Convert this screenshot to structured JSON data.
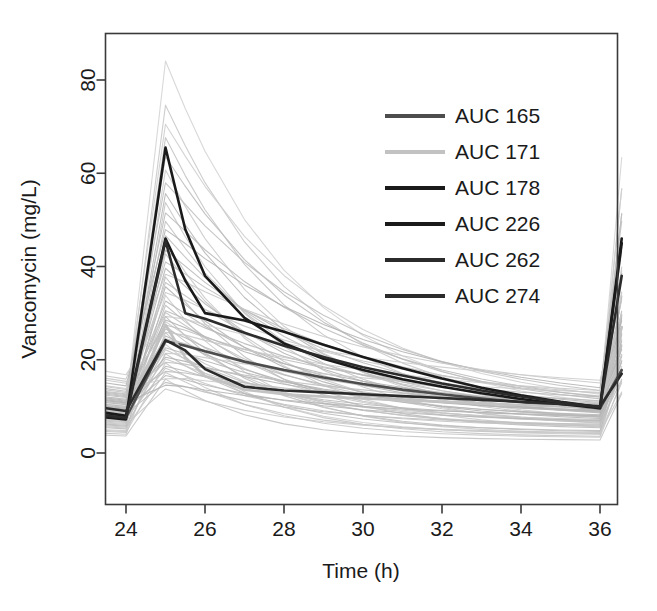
{
  "chart_data": {
    "type": "line",
    "title": "",
    "xlabel": "Time (h)",
    "ylabel": "Vancomycin (mg/L)",
    "xlim": [
      23.5,
      36.6
    ],
    "ylim": [
      -2,
      88
    ],
    "xticks": [
      24,
      26,
      28,
      30,
      32,
      34,
      36
    ],
    "xtick_labels": [
      "24",
      "26",
      "28",
      "30",
      "32",
      "34",
      "36"
    ],
    "yticks": [
      0,
      20,
      40,
      60,
      80
    ],
    "ytick_labels": [
      "0",
      "20",
      "40",
      "60",
      "80"
    ],
    "grid": false,
    "legend_position": "top-right",
    "x": [
      23.5,
      24.0,
      25.0,
      25.5,
      26.0,
      27.0,
      28.0,
      29.0,
      30.0,
      31.0,
      32.0,
      33.0,
      34.0,
      35.0,
      36.0,
      36.55
    ],
    "highlighted_series": [
      {
        "name": "AUC 165",
        "label": "AUC 165",
        "color": "#4d4d4d",
        "width": 2.6,
        "values": [
          8.2,
          7.6,
          24.0,
          23.0,
          21.8,
          19.6,
          17.8,
          16.2,
          14.8,
          13.6,
          12.6,
          11.7,
          10.9,
          10.2,
          9.6,
          17.8
        ]
      },
      {
        "name": "AUC 171",
        "label": "AUC 171",
        "color": "#c2c2c2",
        "width": 2.6,
        "values": [
          9.0,
          8.4,
          27.5,
          20.5,
          16.5,
          13.6,
          12.6,
          12.1,
          11.7,
          11.3,
          11.0,
          10.6,
          10.3,
          10.0,
          9.7,
          27.0
        ]
      },
      {
        "name": "AUC 178",
        "label": "AUC 178",
        "color": "#1a1a1a",
        "width": 2.6,
        "values": [
          8.6,
          8.0,
          46.0,
          37.0,
          30.0,
          28.4,
          26.0,
          23.2,
          20.6,
          18.2,
          16.0,
          14.0,
          12.4,
          11.0,
          9.8,
          46.0
        ]
      },
      {
        "name": "AUC 226",
        "label": "AUC 226",
        "color": "#1a1a1a",
        "width": 2.6,
        "values": [
          7.6,
          7.2,
          65.5,
          48.0,
          38.0,
          29.0,
          23.5,
          20.2,
          17.8,
          15.8,
          14.2,
          12.8,
          11.6,
          10.5,
          9.6,
          45.0
        ]
      },
      {
        "name": "AUC 262",
        "label": "AUC 262",
        "color": "#2b2b2b",
        "width": 2.6,
        "values": [
          8.0,
          7.5,
          45.5,
          30.0,
          28.8,
          25.8,
          23.0,
          20.6,
          18.4,
          16.6,
          14.9,
          13.4,
          12.1,
          10.9,
          9.8,
          38.0
        ]
      },
      {
        "name": "AUC 274",
        "label": "AUC 274",
        "color": "#2b2b2b",
        "width": 2.6,
        "values": [
          9.6,
          9.0,
          24.2,
          22.0,
          18.0,
          14.2,
          13.4,
          13.0,
          12.6,
          12.2,
          11.8,
          11.4,
          11.0,
          10.5,
          10.0,
          17.0
        ]
      }
    ],
    "background_series_count": 60,
    "background_color": "#b0b0b0",
    "background_description": "Spaghetti plot of individual vancomycin concentration-time profiles; trough ~2-18 mg/L before the 24 h dose, peaks 20-85 mg/L at 25 h, decaying to troughs 2-17 mg/L at 36 h, then rising again after the 36 h dose.",
    "background_series": [
      {
        "peak": 84.5,
        "trough0": 10.5,
        "trough36": 11.0,
        "decay": 0.3,
        "shade": "#d4d4d4"
      },
      {
        "peak": 75.0,
        "trough0": 9.8,
        "trough36": 10.2,
        "decay": 0.29,
        "shade": "#c9c9c9"
      },
      {
        "peak": 71.0,
        "trough0": 12.0,
        "trough36": 12.6,
        "decay": 0.25,
        "shade": "#cfcfcf"
      },
      {
        "peak": 68.0,
        "trough0": 8.8,
        "trough36": 9.2,
        "decay": 0.3,
        "shade": "#c4c4c4"
      },
      {
        "peak": 64.0,
        "trough0": 11.2,
        "trough36": 11.6,
        "decay": 0.26,
        "shade": "#bdbdbd"
      },
      {
        "peak": 61.0,
        "trough0": 7.4,
        "trough36": 7.8,
        "decay": 0.32,
        "shade": "#cccccc"
      },
      {
        "peak": 58.5,
        "trough0": 13.5,
        "trough36": 13.4,
        "decay": 0.22,
        "shade": "#c0c0c0"
      },
      {
        "peak": 56.0,
        "trough0": 9.0,
        "trough36": 8.6,
        "decay": 0.31,
        "shade": "#b8b8b8"
      },
      {
        "peak": 54.0,
        "trough0": 6.6,
        "trough36": 6.4,
        "decay": 0.34,
        "shade": "#c7c7c7"
      },
      {
        "peak": 52.0,
        "trough0": 12.8,
        "trough36": 12.0,
        "decay": 0.21,
        "shade": "#bbbbbb"
      },
      {
        "peak": 50.0,
        "trough0": 8.2,
        "trough36": 7.6,
        "decay": 0.3,
        "shade": "#c3c3c3"
      },
      {
        "peak": 48.5,
        "trough0": 15.0,
        "trough36": 14.0,
        "decay": 0.19,
        "shade": "#b5b5b5"
      },
      {
        "peak": 47.0,
        "trough0": 10.0,
        "trough36": 9.4,
        "decay": 0.27,
        "shade": "#c1c1c1"
      },
      {
        "peak": 45.5,
        "trough0": 5.8,
        "trough36": 5.6,
        "decay": 0.36,
        "shade": "#cacaca"
      },
      {
        "peak": 44.0,
        "trough0": 11.6,
        "trough36": 10.8,
        "decay": 0.23,
        "shade": "#b9b9b9"
      },
      {
        "peak": 43.0,
        "trough0": 7.0,
        "trough36": 6.8,
        "decay": 0.33,
        "shade": "#c5c5c5"
      },
      {
        "peak": 41.5,
        "trough0": 13.0,
        "trough36": 12.2,
        "decay": 0.2,
        "shade": "#bebebe"
      },
      {
        "peak": 40.0,
        "trough0": 9.4,
        "trough36": 8.8,
        "decay": 0.28,
        "shade": "#b7b7b7"
      },
      {
        "peak": 39.0,
        "trough0": 16.5,
        "trough36": 15.0,
        "decay": 0.17,
        "shade": "#c8c8c8"
      },
      {
        "peak": 38.0,
        "trough0": 6.2,
        "trough36": 5.4,
        "decay": 0.37,
        "shade": "#bcbcbc"
      },
      {
        "peak": 37.0,
        "trough0": 11.0,
        "trough36": 10.0,
        "decay": 0.24,
        "shade": "#c2c2c2"
      },
      {
        "peak": 36.0,
        "trough0": 8.6,
        "trough36": 7.4,
        "decay": 0.3,
        "shade": "#b4b4b4"
      },
      {
        "peak": 35.0,
        "trough0": 14.2,
        "trough36": 12.8,
        "decay": 0.18,
        "shade": "#c6c6c6"
      },
      {
        "peak": 34.0,
        "trough0": 4.8,
        "trough36": 4.2,
        "decay": 0.4,
        "shade": "#cbcbcb"
      },
      {
        "peak": 33.0,
        "trough0": 10.4,
        "trough36": 9.0,
        "decay": 0.26,
        "shade": "#b6b6b6"
      },
      {
        "peak": 32.0,
        "trough0": 7.8,
        "trough36": 6.6,
        "decay": 0.32,
        "shade": "#c0c0c0"
      },
      {
        "peak": 31.0,
        "trough0": 12.4,
        "trough36": 11.2,
        "decay": 0.21,
        "shade": "#bababa"
      },
      {
        "peak": 30.5,
        "trough0": 9.2,
        "trough36": 8.0,
        "decay": 0.29,
        "shade": "#c4c4c4"
      },
      {
        "peak": 30.0,
        "trough0": 17.5,
        "trough36": 15.6,
        "decay": 0.15,
        "shade": "#cdcdcd"
      },
      {
        "peak": 29.5,
        "trough0": 5.4,
        "trough36": 4.6,
        "decay": 0.38,
        "shade": "#bfbfbf"
      },
      {
        "peak": 29.0,
        "trough0": 11.8,
        "trough36": 10.4,
        "decay": 0.22,
        "shade": "#b3b3b3"
      },
      {
        "peak": 28.5,
        "trough0": 8.0,
        "trough36": 6.8,
        "decay": 0.31,
        "shade": "#c7c7c7"
      },
      {
        "peak": 28.0,
        "trough0": 13.8,
        "trough36": 12.0,
        "decay": 0.19,
        "shade": "#bdbdbd"
      },
      {
        "peak": 27.5,
        "trough0": 6.8,
        "trough36": 5.8,
        "decay": 0.35,
        "shade": "#c1c1c1"
      },
      {
        "peak": 27.0,
        "trough0": 10.2,
        "trough36": 8.8,
        "decay": 0.25,
        "shade": "#b8b8b8"
      },
      {
        "peak": 26.5,
        "trough0": 15.6,
        "trough36": 13.4,
        "decay": 0.16,
        "shade": "#c9c9c9"
      },
      {
        "peak": 26.0,
        "trough0": 4.2,
        "trough36": 3.6,
        "decay": 0.42,
        "shade": "#c5c5c5"
      },
      {
        "peak": 25.5,
        "trough0": 9.6,
        "trough36": 8.2,
        "decay": 0.27,
        "shade": "#b5b5b5"
      },
      {
        "peak": 25.0,
        "trough0": 12.0,
        "trough36": 10.2,
        "decay": 0.2,
        "shade": "#bebebe"
      },
      {
        "peak": 24.5,
        "trough0": 7.2,
        "trough36": 6.0,
        "decay": 0.33,
        "shade": "#c3c3c3"
      },
      {
        "peak": 24.0,
        "trough0": 14.8,
        "trough36": 12.4,
        "decay": 0.17,
        "shade": "#babab a"
      },
      {
        "peak": 23.5,
        "trough0": 5.0,
        "trough36": 4.0,
        "decay": 0.39,
        "shade": "#cccccc"
      },
      {
        "peak": 23.0,
        "trough0": 10.8,
        "trough36": 9.0,
        "decay": 0.24,
        "shade": "#b6b6b6"
      },
      {
        "peak": 22.5,
        "trough0": 8.4,
        "trough36": 6.8,
        "decay": 0.3,
        "shade": "#c2c2c2"
      },
      {
        "peak": 22.0,
        "trough0": 16.0,
        "trough36": 13.0,
        "decay": 0.15,
        "shade": "#cacaca"
      },
      {
        "peak": 21.5,
        "trough0": 6.0,
        "trough36": 4.8,
        "decay": 0.36,
        "shade": "#bcbcbc"
      },
      {
        "peak": 21.0,
        "trough0": 11.4,
        "trough36": 9.2,
        "decay": 0.22,
        "shade": "#b4b4b4"
      },
      {
        "peak": 20.5,
        "trough0": 9.0,
        "trough36": 7.2,
        "decay": 0.28,
        "shade": "#c6c6c6"
      },
      {
        "peak": 20.0,
        "trough0": 13.2,
        "trough36": 10.6,
        "decay": 0.18,
        "shade": "#c0c0c0"
      },
      {
        "peak": 19.5,
        "trough0": 4.6,
        "trough36": 3.4,
        "decay": 0.41,
        "shade": "#c8c8c8"
      },
      {
        "peak": 19.0,
        "trough0": 10.0,
        "trough36": 7.8,
        "decay": 0.25,
        "shade": "#b9b9b9"
      },
      {
        "peak": 18.5,
        "trough0": 7.6,
        "trough36": 5.8,
        "decay": 0.32,
        "shade": "#c4c4c4"
      },
      {
        "peak": 18.0,
        "trough0": 12.6,
        "trough36": 9.8,
        "decay": 0.19,
        "shade": "#bdbdbd"
      },
      {
        "peak": 17.5,
        "trough0": 5.6,
        "trough36": 4.2,
        "decay": 0.37,
        "shade": "#c7c7c7"
      },
      {
        "peak": 17.0,
        "trough0": 9.8,
        "trough36": 7.0,
        "decay": 0.26,
        "shade": "#b7b7b7"
      },
      {
        "peak": 16.5,
        "trough0": 14.4,
        "trough36": 10.8,
        "decay": 0.16,
        "shade": "#cbcbcb"
      },
      {
        "peak": 16.0,
        "trough0": 3.8,
        "trough36": 2.8,
        "decay": 0.44,
        "shade": "#c3c3c3"
      },
      {
        "peak": 15.5,
        "trough0": 8.8,
        "trough36": 6.2,
        "decay": 0.29,
        "shade": "#bfbfbf"
      },
      {
        "peak": 15.0,
        "trough0": 11.2,
        "trough36": 8.0,
        "decay": 0.21,
        "shade": "#b5b5b5"
      },
      {
        "peak": 14.0,
        "trough0": 6.4,
        "trough36": 4.4,
        "decay": 0.34,
        "shade": "#c9c9c9"
      }
    ],
    "dose_times": [
      24,
      36
    ],
    "peak_time": 25,
    "end_time": 36.55
  },
  "axes": {
    "x_axis_title": "Time (h)",
    "y_axis_title": "Vancomycin (mg/L)"
  },
  "legend": {
    "entries": [
      {
        "label": "AUC 165",
        "color": "#4d4d4d"
      },
      {
        "label": "AUC 171",
        "color": "#c2c2c2"
      },
      {
        "label": "AUC 178",
        "color": "#1a1a1a"
      },
      {
        "label": "AUC 226",
        "color": "#1a1a1a"
      },
      {
        "label": "AUC 262",
        "color": "#2b2b2b"
      },
      {
        "label": "AUC 274",
        "color": "#2b2b2b"
      }
    ]
  }
}
